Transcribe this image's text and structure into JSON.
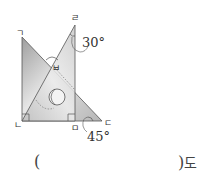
{
  "figure": {
    "vertices": {
      "giyeok": "ㄱ",
      "nieun": "ㄴ",
      "digeut": "ㄷ",
      "rieul": "ㄹ",
      "mieum": "ㅁ",
      "bieup": "ㅂ"
    },
    "angles": {
      "top_angle": "30°",
      "bottom_angle": "45°"
    },
    "colors": {
      "fill_light": "#d9d9d9",
      "fill_dark": "#a8a8a8",
      "stroke": "#555555"
    }
  },
  "answer": {
    "open_paren": "(",
    "value": "",
    "close_paren": ")",
    "unit": "도"
  }
}
